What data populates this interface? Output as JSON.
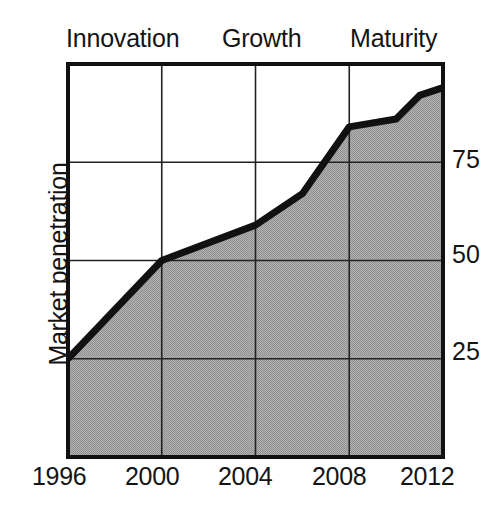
{
  "figure": {
    "kind": "area-line-chart",
    "background_color": "#ffffff",
    "ink_color": "#141414"
  },
  "phases": {
    "title_row": [
      {
        "name": "innovation-phase-label",
        "label": "Innovation"
      },
      {
        "name": "growth-phase-label",
        "label": "Growth"
      },
      {
        "name": "maturity-phase-label",
        "label": "Maturity"
      }
    ]
  },
  "axes": {
    "y_title": "Market penetration",
    "y_ticks": [
      "75",
      "50",
      "25"
    ],
    "x_ticks": [
      "1996",
      "2000",
      "2004",
      "2008",
      "2012"
    ]
  },
  "chart_data": {
    "type": "area",
    "title": "",
    "subtitle": "",
    "xlabel": "",
    "ylabel": "Market penetration",
    "x": [
      1996,
      2000,
      2004,
      2006,
      2008,
      2010,
      2011,
      2012
    ],
    "values": [
      25,
      50,
      59,
      67,
      84,
      86,
      92,
      94
    ],
    "series": [
      {
        "name": "Market penetration",
        "x": [
          1996,
          2000,
          2004,
          2006,
          2008,
          2010,
          2011,
          2012
        ],
        "values": [
          25,
          50,
          59,
          67,
          84,
          86,
          92,
          94
        ]
      }
    ],
    "xlim": [
      1996,
      2012
    ],
    "ylim": [
      0,
      100
    ],
    "x_tick_values": [
      1996,
      2000,
      2004,
      2008,
      2012
    ],
    "y_tick_values": [
      25,
      50,
      75
    ],
    "grid": true,
    "legend": "none",
    "fill_color": "#a3a3a3",
    "line_color": "#111111",
    "annotations": [
      {
        "text": "Innovation",
        "x_range": [
          1996,
          2000
        ],
        "position": "above-plot"
      },
      {
        "text": "Growth",
        "x_range": [
          2000,
          2008
        ],
        "position": "above-plot"
      },
      {
        "text": "Maturity",
        "x_range": [
          2008,
          2012
        ],
        "position": "above-plot"
      }
    ]
  }
}
